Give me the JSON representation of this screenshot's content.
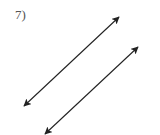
{
  "problem": {
    "number_label": "7)"
  },
  "diagram": {
    "stroke_color": "#222222",
    "lines": [
      {
        "name": "line-1",
        "x1": 24,
        "y1": 106,
        "x2": 119,
        "y2": 17
      },
      {
        "name": "line-2",
        "x1": 45,
        "y1": 134,
        "x2": 138,
        "y2": 47
      }
    ]
  }
}
